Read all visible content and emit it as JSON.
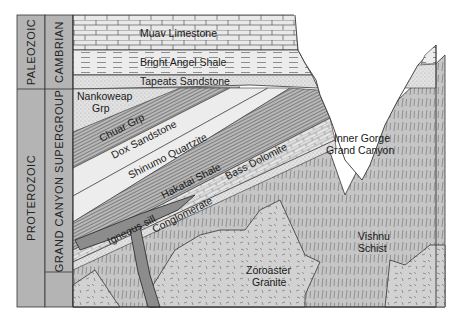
{
  "diagram": {
    "type": "geologic-cross-section",
    "timescale": {
      "eras": [
        {
          "label": "PALEOZOIC"
        },
        {
          "label": "PROTEROZOIC"
        }
      ],
      "systems": [
        {
          "label": "CAMBRIAN"
        },
        {
          "label": "GRAND CANYON SUPERGROUP"
        }
      ]
    },
    "layers": [
      {
        "label": "Muav Limestone",
        "pattern": "brick"
      },
      {
        "label": "Bright Angel Shale",
        "pattern": "dashed"
      },
      {
        "label": "Tapeats Sandstone",
        "pattern": "stipple"
      },
      {
        "label": "Nankoweap",
        "label2": "Grp",
        "pattern": "stipple"
      },
      {
        "label": "Chuar Grp",
        "pattern": "lined"
      },
      {
        "label": "Dox Sandstone",
        "pattern": "light"
      },
      {
        "label": "Shinumo Quartzite",
        "pattern": "light"
      },
      {
        "label": "Hakatai Shale",
        "pattern": "lined"
      },
      {
        "label": "Bass Dolomite",
        "pattern": "brick"
      },
      {
        "label": "Conglomerate",
        "pattern": "dotted"
      },
      {
        "label": "Igneous sill",
        "pattern": "dark"
      }
    ],
    "basement": [
      {
        "label": "Zoroaster",
        "label2": "Granite"
      },
      {
        "label": "Vishnu",
        "label2": "Schist"
      }
    ],
    "feature": {
      "label": "Inner Gorge",
      "label2": "Grand Canyon"
    },
    "colors": {
      "column_fill": "#b4b4b4",
      "layer_light": "#ececec",
      "layer_mid": "#c8c8c8",
      "layer_dark": "#8c8c8c",
      "basement": "#cfcfcf",
      "line": "#2a2a2a"
    }
  }
}
